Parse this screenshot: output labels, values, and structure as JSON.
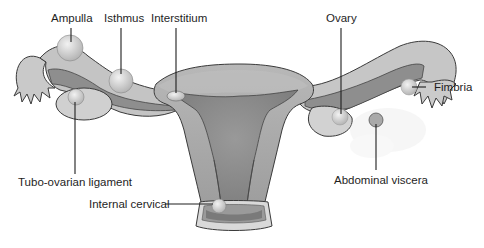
{
  "diagram": {
    "colors": {
      "background": "#ffffff",
      "tube_light": "#c4c4c4",
      "tube_dark": "#8a8a8a",
      "uterus_body": "#a8a8a8",
      "uterus_cavity": "#8e8e8e",
      "cervix_collar": "#d9d9d9",
      "ovary": "#d6d6d6",
      "implant_site": "#e2e2e2",
      "text": "#1e1e1e"
    },
    "labels": [
      {
        "id": "ampulla",
        "text": "Ampulla"
      },
      {
        "id": "isthmus",
        "text": "Isthmus"
      },
      {
        "id": "interstitium",
        "text": "Interstitium"
      },
      {
        "id": "ovary",
        "text": "Ovary"
      },
      {
        "id": "fimbria",
        "text": "Fimbria"
      },
      {
        "id": "tubo_ovarian",
        "text": "Tubo-ovarian ligament"
      },
      {
        "id": "abdominal",
        "text": "Abdominal viscera"
      },
      {
        "id": "cervical",
        "text": "Internal cervical"
      }
    ]
  }
}
